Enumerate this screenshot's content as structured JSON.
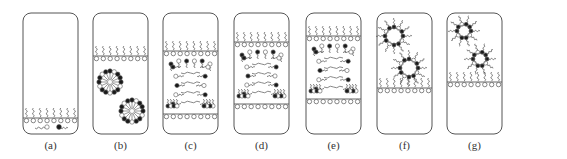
{
  "figure": {
    "colors": {
      "stroke": "#555555",
      "fill_dark": "#1a1a1a",
      "fill_light": "#ffffff",
      "label": "#333333"
    },
    "panels": [
      {
        "id": "a",
        "label": "(a)",
        "x": 23,
        "interfaces": [
          118
        ],
        "state": "single monolayer at bottom with free molecules below"
      },
      {
        "id": "b",
        "label": "(b)",
        "x": 93,
        "interfaces": [
          56
        ],
        "state": "monolayer above two micelles"
      },
      {
        "id": "c",
        "label": "(c)",
        "x": 163,
        "interfaces": [
          51,
          114
        ],
        "state": "bridge between two monolayers"
      },
      {
        "id": "d",
        "label": "(d)",
        "x": 234,
        "interfaces": [
          42,
          104
        ],
        "state": "narrowed bridge"
      },
      {
        "id": "e",
        "label": "(e)",
        "x": 306,
        "interfaces": [
          36,
          99
        ],
        "state": "hemifused bridge"
      },
      {
        "id": "f",
        "label": "(f)",
        "x": 377,
        "interfaces": [
          88
        ],
        "state": "two inverted micelles above monolayer"
      },
      {
        "id": "g",
        "label": "(g)",
        "x": 447,
        "interfaces": [
          82
        ],
        "state": "two inverted micelles closer to monolayer"
      }
    ],
    "box": {
      "top": 13,
      "width": 55,
      "height": 121,
      "radius": 8
    }
  }
}
